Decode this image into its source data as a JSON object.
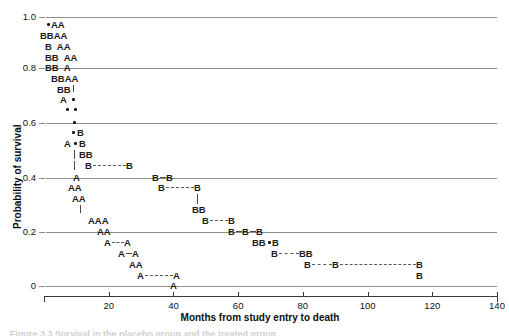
{
  "figure": {
    "type": "kaplan-meier-survival-plot",
    "xlabel": "Months from study entry to death",
    "ylabel": "Probability of survival",
    "caption": "Figure 3.3 Survival in the placebo group and the treated group",
    "colors": {
      "gridline": "#8d8d8d",
      "axis": "#3a3a3a",
      "glyph": "#1a1a1a",
      "connector": "#5a5a5a"
    }
  },
  "chart_data": {
    "type": "line",
    "title": "",
    "xlabel": "Months from study entry to death",
    "ylabel": "Probability of survival",
    "xlim": [
      0,
      140
    ],
    "ylim": [
      0,
      1.0
    ],
    "xticks": [
      0,
      20,
      40,
      60,
      80,
      100,
      120,
      140
    ],
    "xtick_labels": [
      "",
      "20",
      "40",
      "60",
      "80",
      "100",
      "120",
      "140"
    ],
    "yticks": [
      0,
      0.2,
      0.4,
      0.6,
      0.8,
      1.0
    ],
    "ytick_labels": [
      "0",
      "0.2",
      "0.4",
      "0.6",
      "0.8",
      "1.0"
    ],
    "grid": "horizontal",
    "legend": "none",
    "marker_labels": [
      "A",
      "B",
      "•"
    ],
    "note": "Step-like scatter of letter markers: A = treatment group A, B = treatment group B, dot = censored/overlapping observation. Markers are plotted at (months, survival probability).",
    "series": [
      {
        "name": "A",
        "points": [
          [
            4.5,
            0.975
          ],
          [
            7.0,
            0.975
          ],
          [
            6.5,
            0.945
          ],
          [
            9.0,
            0.945
          ],
          [
            7.5,
            0.915
          ],
          [
            10.5,
            0.915
          ],
          [
            9.0,
            0.885
          ],
          [
            12.0,
            0.885
          ],
          [
            11.0,
            0.855
          ],
          [
            12.5,
            0.825
          ],
          [
            15.0,
            0.825
          ],
          [
            14.5,
            0.795
          ],
          [
            12.5,
            0.765
          ],
          [
            15.5,
            0.705
          ],
          [
            17.0,
            0.675
          ],
          [
            17.5,
            0.405
          ],
          [
            16.5,
            0.375
          ],
          [
            19.0,
            0.375
          ],
          [
            18.0,
            0.345
          ],
          [
            20.5,
            0.345
          ],
          [
            21.0,
            0.255
          ],
          [
            23.5,
            0.255
          ],
          [
            26.0,
            0.255
          ],
          [
            24.0,
            0.205
          ],
          [
            26.5,
            0.205
          ],
          [
            26.5,
            0.175
          ],
          [
            33.0,
            0.175
          ],
          [
            31.0,
            0.145
          ],
          [
            35.5,
            0.145
          ],
          [
            34.5,
            0.115
          ],
          [
            37.0,
            0.115
          ],
          [
            37.0,
            0.085
          ],
          [
            49.0,
            0.085
          ],
          [
            49.0,
            0.03
          ]
        ]
      },
      {
        "name": "B",
        "points": [
          [
            8.5,
            0.945
          ],
          [
            11.5,
            0.945
          ],
          [
            9.0,
            0.915
          ],
          [
            10.0,
            0.885
          ],
          [
            12.5,
            0.885
          ],
          [
            11.0,
            0.855
          ],
          [
            13.5,
            0.855
          ],
          [
            12.0,
            0.825
          ],
          [
            14.5,
            0.825
          ],
          [
            14.0,
            0.795
          ],
          [
            16.5,
            0.795
          ],
          [
            21.5,
            0.555
          ],
          [
            22.5,
            0.525
          ],
          [
            22.5,
            0.495
          ],
          [
            25.0,
            0.495
          ],
          [
            25.0,
            0.465
          ],
          [
            38.0,
            0.465
          ],
          [
            37.5,
            0.405
          ],
          [
            40.5,
            0.405
          ],
          [
            39.5,
            0.375
          ],
          [
            48.5,
            0.375
          ],
          [
            48.0,
            0.285
          ],
          [
            50.5,
            0.285
          ],
          [
            51.5,
            0.255
          ],
          [
            57.5,
            0.255
          ],
          [
            57.0,
            0.205
          ],
          [
            61.0,
            0.205
          ],
          [
            64.5,
            0.205
          ],
          [
            62.0,
            0.175
          ],
          [
            64.5,
            0.175
          ],
          [
            68.5,
            0.175
          ],
          [
            70.0,
            0.145
          ],
          [
            79.0,
            0.145
          ],
          [
            81.5,
            0.145
          ],
          [
            84.0,
            0.115
          ],
          [
            90.0,
            0.115
          ],
          [
            122.0,
            0.115
          ],
          [
            122.0,
            0.085
          ]
        ]
      },
      {
        "name": "censored-dot",
        "points": [
          [
            3.2,
            0.975
          ],
          [
            15.0,
            0.765
          ],
          [
            17.5,
            0.765
          ],
          [
            16.0,
            0.735
          ],
          [
            18.5,
            0.705
          ],
          [
            20.5,
            0.675
          ],
          [
            21.5,
            0.645
          ],
          [
            69.0,
            0.285
          ]
        ]
      }
    ]
  },
  "axis_labels": {
    "y": [
      "1.0",
      "0.8",
      "0.6",
      "0.4",
      "0.2",
      "0"
    ],
    "x": [
      "20",
      "40",
      "60",
      "80",
      "100",
      "120",
      "140"
    ]
  },
  "rows": [
    {
      "y": 25,
      "items": [
        {
          "t": "dot",
          "x": 47
        },
        {
          "t": "txt",
          "x": 51,
          "s": "AA"
        }
      ]
    },
    {
      "y": 36,
      "items": [
        {
          "t": "txt",
          "x": 40,
          "s": "BBAA"
        }
      ]
    },
    {
      "y": 47,
      "items": [
        {
          "t": "txt",
          "x": 45,
          "s": "B  AA"
        }
      ]
    },
    {
      "y": 58,
      "items": [
        {
          "t": "txt",
          "x": 45,
          "s": "BB  AA"
        }
      ]
    },
    {
      "y": 68,
      "items": [
        {
          "t": "txt",
          "x": 45,
          "s": "BB  A"
        }
      ]
    },
    {
      "y": 79,
      "items": [
        {
          "t": "txt",
          "x": 51,
          "s": "BBAA"
        }
      ]
    },
    {
      "y": 90,
      "items": [
        {
          "t": "txt",
          "x": 57,
          "s": "BB"
        },
        {
          "t": "vseg",
          "x": 73,
          "h": 7
        }
      ]
    },
    {
      "y": 100,
      "items": [
        {
          "t": "txt",
          "x": 60,
          "s": "A"
        },
        {
          "t": "dot",
          "x": 72
        }
      ]
    },
    {
      "y": 110,
      "items": [
        {
          "t": "dot",
          "x": 66
        },
        {
          "t": "dot",
          "x": 74
        }
      ]
    },
    {
      "y": 123,
      "items": [
        {
          "t": "dot",
          "x": 73
        }
      ]
    },
    {
      "y": 133,
      "items": [
        {
          "t": "dot",
          "x": 72
        },
        {
          "t": "txt",
          "x": 77,
          "s": "B"
        }
      ]
    },
    {
      "y": 144,
      "items": [
        {
          "t": "txt",
          "x": 64,
          "s": "A"
        },
        {
          "t": "dot",
          "x": 74
        },
        {
          "t": "txt",
          "x": 79,
          "s": "B"
        }
      ]
    },
    {
      "y": 155,
      "items": [
        {
          "t": "vseg",
          "x": 74,
          "h": 9
        },
        {
          "t": "txt",
          "x": 79,
          "s": "BB"
        }
      ]
    },
    {
      "y": 166,
      "items": [
        {
          "t": "vseg",
          "x": 74,
          "h": 9
        },
        {
          "t": "txt",
          "x": 85,
          "s": "B"
        },
        {
          "t": "dash",
          "x": 93,
          "w": 33
        },
        {
          "t": "txt",
          "x": 126,
          "s": "B"
        }
      ]
    },
    {
      "y": 178,
      "items": [
        {
          "t": "txt",
          "x": 73,
          "s": "A"
        },
        {
          "t": "txt",
          "x": 152,
          "s": "B"
        },
        {
          "t": "solid",
          "x": 160,
          "w": 6
        },
        {
          "t": "txt",
          "x": 166,
          "s": "B"
        }
      ]
    },
    {
      "y": 188,
      "items": [
        {
          "t": "txt",
          "x": 68,
          "s": "AA"
        },
        {
          "t": "txt",
          "x": 158,
          "s": "B"
        },
        {
          "t": "dash",
          "x": 166,
          "w": 28
        },
        {
          "t": "txt",
          "x": 194,
          "s": "B"
        }
      ]
    },
    {
      "y": 199,
      "items": [
        {
          "t": "txt",
          "x": 72,
          "s": "AA"
        },
        {
          "t": "vseg",
          "x": 197,
          "h": 10
        }
      ]
    },
    {
      "y": 210,
      "items": [
        {
          "t": "vseg",
          "x": 80,
          "h": 8
        },
        {
          "t": "txt",
          "x": 192,
          "s": "BB"
        }
      ]
    },
    {
      "y": 221,
      "items": [
        {
          "t": "txt",
          "x": 88,
          "s": "AAA"
        },
        {
          "t": "txt",
          "x": 202,
          "s": "B"
        },
        {
          "t": "dash",
          "x": 210,
          "w": 18
        },
        {
          "t": "txt",
          "x": 228,
          "s": "B"
        }
      ]
    },
    {
      "y": 232,
      "items": [
        {
          "t": "txt",
          "x": 97,
          "s": "AA"
        },
        {
          "t": "txt",
          "x": 228,
          "s": "B"
        },
        {
          "t": "solid",
          "x": 236,
          "w": 6
        },
        {
          "t": "txt",
          "x": 242,
          "s": "B"
        },
        {
          "t": "solid",
          "x": 250,
          "w": 6
        },
        {
          "t": "txt",
          "x": 256,
          "s": "B"
        }
      ]
    },
    {
      "y": 243,
      "items": [
        {
          "t": "txt",
          "x": 104,
          "s": "A"
        },
        {
          "t": "dash",
          "x": 112,
          "w": 12
        },
        {
          "t": "txt",
          "x": 124,
          "s": "A"
        },
        {
          "t": "txt",
          "x": 252,
          "s": "BB"
        },
        {
          "t": "dot",
          "x": 268
        },
        {
          "t": "txt",
          "x": 272,
          "s": "B"
        }
      ]
    },
    {
      "y": 254,
      "items": [
        {
          "t": "txt",
          "x": 118,
          "s": "A"
        },
        {
          "t": "solid",
          "x": 126,
          "w": 6
        },
        {
          "t": "txt",
          "x": 132,
          "s": "A"
        },
        {
          "t": "txt",
          "x": 271,
          "s": "B"
        },
        {
          "t": "dash",
          "x": 279,
          "w": 20
        },
        {
          "t": "txt",
          "x": 299,
          "s": "BB"
        }
      ]
    },
    {
      "y": 265,
      "items": [
        {
          "t": "txt",
          "x": 129,
          "s": "AA"
        },
        {
          "t": "txt",
          "x": 304,
          "s": "B"
        },
        {
          "t": "dash",
          "x": 312,
          "w": 20
        },
        {
          "t": "txt",
          "x": 332,
          "s": "B"
        },
        {
          "t": "dash",
          "x": 340,
          "w": 76
        },
        {
          "t": "txt",
          "x": 416,
          "s": "B"
        }
      ]
    },
    {
      "y": 276,
      "items": [
        {
          "t": "txt",
          "x": 137,
          "s": "A"
        },
        {
          "t": "dash",
          "x": 145,
          "w": 28
        },
        {
          "t": "txt",
          "x": 173,
          "s": "A"
        },
        {
          "t": "txt",
          "x": 416,
          "s": "B"
        }
      ]
    },
    {
      "y": 286,
      "items": [
        {
          "t": "txt",
          "x": 170,
          "s": "A"
        }
      ]
    }
  ]
}
